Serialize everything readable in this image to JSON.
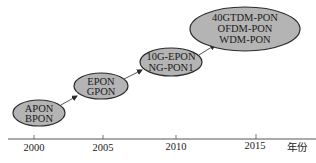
{
  "diagram": {
    "type": "timeline",
    "colors": {
      "node_fill": "#b4b4b4",
      "node_stroke": "#2a2a2a",
      "arrow": "#2a2a2a",
      "axis": "#555555",
      "background": "#ffffff"
    },
    "nodes": [
      {
        "id": "n1",
        "lines": [
          "APON",
          "BPON"
        ],
        "year": 2000
      },
      {
        "id": "n2",
        "lines": [
          "EPON",
          "GPON"
        ],
        "year": 2005
      },
      {
        "id": "n3",
        "lines": [
          "10G-EPON",
          "NG-PON1"
        ],
        "year": 2010
      },
      {
        "id": "n4",
        "lines": [
          "40GTDM-PON",
          "OFDM-PON",
          "WDM-PON"
        ],
        "year": 2015
      }
    ],
    "edges": [
      {
        "from": "n1",
        "to": "n2"
      },
      {
        "from": "n2",
        "to": "n3"
      },
      {
        "from": "n3",
        "to": "n4"
      }
    ],
    "axis": {
      "ticks": [
        "2000",
        "2005",
        "2010",
        "2015"
      ],
      "unit_label": "年份"
    }
  }
}
